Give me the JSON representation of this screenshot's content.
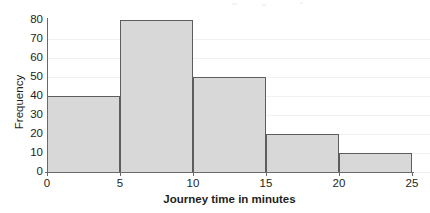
{
  "chart_data": {
    "type": "bar",
    "title": "",
    "subtitle": "",
    "xlabel": "Journey time in minutes",
    "ylabel": "Frequency",
    "categories": [
      "0-5",
      "5-10",
      "10-15",
      "15-20",
      "20-25"
    ],
    "bin_edges": [
      0,
      5,
      10,
      15,
      20,
      25
    ],
    "values": [
      40,
      80,
      50,
      20,
      10
    ],
    "xlim": [
      0,
      25
    ],
    "ylim": [
      0,
      80
    ],
    "xticks": [
      "0",
      "5",
      "10",
      "15",
      "20",
      "25"
    ],
    "yticks": [
      "0",
      "10",
      "20",
      "30",
      "40",
      "50",
      "60",
      "70",
      "80"
    ],
    "grid": "horizontal",
    "legend": "none",
    "bar_fill_color": "#d8d8d8",
    "bar_stroke_color": "#5d5d5d",
    "gridline_color": "#f1f1f1",
    "axis_color": "#6a6a6a",
    "text_color": "#231f20",
    "background_color": "#ffffff"
  }
}
